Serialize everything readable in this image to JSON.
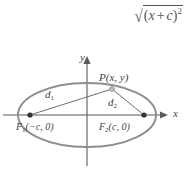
{
  "formula": {
    "name": "sqrt-of-x-plus-c-squared",
    "radical_symbol": "√",
    "radicand_open": "(",
    "radicand_var": "x",
    "radicand_operator": "+",
    "radicand_const": "c",
    "radicand_close": ")",
    "exponent": "2",
    "plain_text": "√((x + c)²)"
  },
  "diagram": {
    "axes": {
      "x_label": "x",
      "y_label": "y"
    },
    "point_p": {
      "label_name": "P",
      "label_coords": "(x, y)",
      "x_text": "x",
      "y_text": "y"
    },
    "focus_left": {
      "label_name": "F",
      "subscript": "1",
      "coords": "(−c, 0)"
    },
    "focus_right": {
      "label_name": "F",
      "subscript": "2",
      "coords": "(c, 0)"
    },
    "distance_1": {
      "label_name": "d",
      "subscript": "1"
    },
    "distance_2": {
      "label_name": "d",
      "subscript": "2"
    }
  },
  "colors": {
    "ellipse_stroke": "#8f8f8f",
    "axis_stroke": "#595959",
    "segment_stroke": "#6e6e6e",
    "text": "#3f3f3f",
    "formula_text": "#555555",
    "background": "#ffffff"
  },
  "geometry": {
    "ellipse_center_x": 87,
    "ellipse_center_y": 67,
    "ellipse_rx": 69,
    "ellipse_ry": 32,
    "focus_left_x": 30,
    "focus_right_x": 144,
    "focus_y": 67,
    "point_p_x": 112,
    "point_p_y": 41,
    "x_axis_y": 67,
    "y_axis_x": 87
  }
}
